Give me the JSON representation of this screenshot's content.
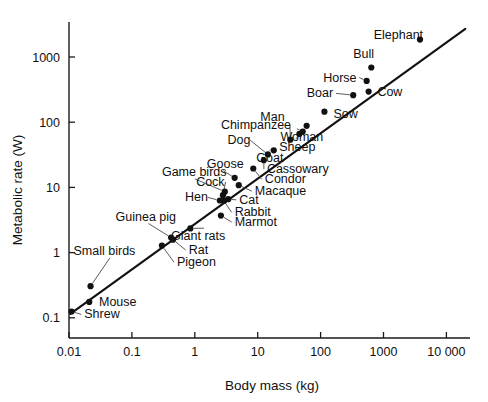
{
  "chart_data": {
    "type": "scatter",
    "title": "",
    "xlabel": "Body mass (kg)",
    "ylabel": "Metabolic rate (W)",
    "xscale": "log",
    "yscale": "log",
    "xlim": [
      0.0085,
      40000
    ],
    "ylim": [
      0.085,
      4000
    ],
    "grid": false,
    "legend": null,
    "xticks": [
      {
        "value": 0.01,
        "label": "0.01"
      },
      {
        "value": 0.1,
        "label": "0.1"
      },
      {
        "value": 1,
        "label": "1"
      },
      {
        "value": 10,
        "label": "10"
      },
      {
        "value": 100,
        "label": "100"
      },
      {
        "value": 1000,
        "label": "1000"
      },
      {
        "value": 10000,
        "label": "10 000"
      }
    ],
    "yticks": [
      {
        "value": 0.1,
        "label": "0.1"
      },
      {
        "value": 1,
        "label": "1"
      },
      {
        "value": 10,
        "label": "10"
      },
      {
        "value": 100,
        "label": "100"
      },
      {
        "value": 1000,
        "label": "1000"
      }
    ],
    "fit_line": {
      "label": "allometric regression line",
      "x_start": 0.0105,
      "y_start": 0.115,
      "x_end": 20000,
      "y_end": 2700
    },
    "points": [
      {
        "name": "Shrew",
        "x": 0.011,
        "y": 0.125,
        "label_x": 0.0175,
        "label_y": 0.098,
        "anchor": "start",
        "leader": true
      },
      {
        "name": "Mouse",
        "x": 0.021,
        "y": 0.175,
        "label_x": 0.03,
        "label_y": 0.15,
        "anchor": "start",
        "leader": false
      },
      {
        "name": "Small birds",
        "x": 0.022,
        "y": 0.305,
        "label_x": 0.0118,
        "label_y": 0.92,
        "anchor": "start",
        "leader": true
      },
      {
        "name": "Pigeon",
        "x": 0.3,
        "y": 1.28,
        "label_x": 0.52,
        "label_y": 0.62,
        "anchor": "start",
        "leader": true
      },
      {
        "name": "Guinea pig",
        "x": 0.42,
        "y": 1.7,
        "label_x": 0.055,
        "label_y": 3.1,
        "anchor": "start",
        "leader": true
      },
      {
        "name": "Rat",
        "x": 0.45,
        "y": 1.58,
        "label_x": 0.8,
        "label_y": 0.95,
        "anchor": "start",
        "leader": true
      },
      {
        "name": "Giant rats",
        "x": 0.85,
        "y": 2.35,
        "label_x": 0.42,
        "label_y": 1.55,
        "anchor": "start",
        "leader": true
      },
      {
        "name": "Marmot",
        "x": 2.6,
        "y": 3.7,
        "label_x": 4.3,
        "label_y": 2.55,
        "anchor": "start",
        "leader": true
      },
      {
        "name": "Rabbit",
        "x": 2.9,
        "y": 6.2,
        "label_x": 4.3,
        "label_y": 3.6,
        "anchor": "start",
        "leader": true
      },
      {
        "name": "Hen",
        "x": 2.5,
        "y": 6.3,
        "label_x": 0.7,
        "label_y": 6.1,
        "anchor": "start",
        "leader": true
      },
      {
        "name": "Cat",
        "x": 3.4,
        "y": 6.6,
        "label_x": 5.1,
        "label_y": 5.6,
        "anchor": "start",
        "leader": true
      },
      {
        "name": "Cock",
        "x": 2.8,
        "y": 7.6,
        "label_x": 1.05,
        "label_y": 10.5,
        "anchor": "start",
        "leader": true
      },
      {
        "name": "Game birds",
        "x": 3.0,
        "y": 8.6,
        "label_x": 0.3,
        "label_y": 15.0,
        "anchor": "start",
        "leader": true
      },
      {
        "name": "Macaque",
        "x": 5.0,
        "y": 10.8,
        "label_x": 9.0,
        "label_y": 7.6,
        "anchor": "start",
        "leader": true
      },
      {
        "name": "Goose",
        "x": 4.3,
        "y": 14.0,
        "label_x": 1.55,
        "label_y": 20.0,
        "anchor": "start",
        "leader": true
      },
      {
        "name": "Condor",
        "x": 8.5,
        "y": 19.5,
        "label_x": 13.0,
        "label_y": 11.5,
        "anchor": "start",
        "leader": true
      },
      {
        "name": "Cassowary",
        "x": 12.5,
        "y": 26.0,
        "label_x": 14.0,
        "label_y": 16.5,
        "anchor": "start",
        "leader": true
      },
      {
        "name": "Dog",
        "x": 14.5,
        "y": 32.0,
        "label_x": 3.3,
        "label_y": 46.0,
        "anchor": "start",
        "leader": true
      },
      {
        "name": "Goat",
        "x": 18.0,
        "y": 37.0,
        "label_x": 9.5,
        "label_y": 24.5,
        "anchor": "start",
        "leader": true
      },
      {
        "name": "Chimpanzee",
        "x": 33.0,
        "y": 54.0,
        "label_x": 2.6,
        "label_y": 78.0,
        "anchor": "start",
        "leader": true
      },
      {
        "name": "Sheep",
        "x": 46.0,
        "y": 66.0,
        "label_x": 22.0,
        "label_y": 36.0,
        "anchor": "start",
        "leader": true
      },
      {
        "name": "Woman",
        "x": 52.0,
        "y": 72.0,
        "label_x": 23.0,
        "label_y": 52.0,
        "anchor": "start",
        "leader": true
      },
      {
        "name": "Man",
        "x": 60.0,
        "y": 88.0,
        "label_x": 11.0,
        "label_y": 105.0,
        "anchor": "start",
        "leader": false
      },
      {
        "name": "Sow",
        "x": 115.0,
        "y": 145.0,
        "label_x": 160.0,
        "label_y": 118.0,
        "anchor": "start",
        "leader": false
      },
      {
        "name": "Boar",
        "x": 330.0,
        "y": 260.0,
        "label_x": 60.0,
        "label_y": 240.0,
        "anchor": "start",
        "leader": true
      },
      {
        "name": "Cow",
        "x": 580.0,
        "y": 295.0,
        "label_x": 800.0,
        "label_y": 255.0,
        "anchor": "start",
        "leader": false
      },
      {
        "name": "Horse",
        "x": 540.0,
        "y": 430.0,
        "label_x": 110.0,
        "label_y": 420.0,
        "anchor": "start",
        "leader": true
      },
      {
        "name": "Bull",
        "x": 640.0,
        "y": 690.0,
        "label_x": 330.0,
        "label_y": 950.0,
        "anchor": "start",
        "leader": false
      },
      {
        "name": "Elephant",
        "x": 3800.0,
        "y": 1850.0,
        "label_x": 700.0,
        "label_y": 1900.0,
        "anchor": "start",
        "leader": false
      }
    ]
  }
}
